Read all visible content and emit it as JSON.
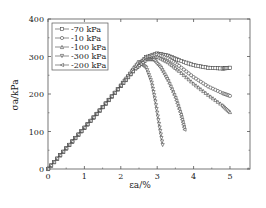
{
  "chart_data": {
    "type": "line",
    "title": "",
    "xlabel": "εa/%",
    "ylabel": "σa/kPa",
    "xlim": [
      0,
      5.55
    ],
    "ylim": [
      0,
      400
    ],
    "xticks": [
      0,
      1,
      2,
      3,
      4,
      5
    ],
    "yticks": [
      0,
      100,
      200,
      300,
      400
    ],
    "grid": false,
    "legend_position": "upper-left",
    "series": [
      {
        "name": "-70 kPa",
        "marker": "square",
        "x": [
          0,
          0.5,
          1.0,
          1.5,
          2.0,
          2.4,
          2.7,
          3.0,
          3.3,
          3.6,
          4.0,
          4.4,
          4.8,
          5.0
        ],
        "y": [
          0,
          55,
          110,
          165,
          222,
          270,
          298,
          308,
          302,
          290,
          277,
          270,
          268,
          270
        ]
      },
      {
        "name": "-10 kPa",
        "marker": "circle",
        "x": [
          0,
          0.5,
          1.0,
          1.5,
          2.0,
          2.4,
          2.7,
          3.0,
          3.3,
          3.6,
          4.0,
          4.4,
          4.8,
          5.0
        ],
        "y": [
          0,
          55,
          110,
          165,
          222,
          270,
          296,
          305,
          295,
          275,
          245,
          220,
          202,
          195
        ]
      },
      {
        "name": "-100 kPa",
        "marker": "triangle-up",
        "x": [
          0,
          0.5,
          1.0,
          1.5,
          2.0,
          2.4,
          2.7,
          3.0,
          3.3,
          3.6,
          4.0,
          4.4,
          4.8,
          5.0
        ],
        "y": [
          0,
          55,
          110,
          165,
          222,
          268,
          293,
          300,
          285,
          262,
          228,
          198,
          170,
          152
        ]
      },
      {
        "name": "-300 kPa",
        "marker": "triangle-down",
        "x": [
          0,
          0.5,
          1.0,
          1.5,
          2.0,
          2.3,
          2.5,
          2.7,
          2.85,
          2.95,
          3.05,
          3.15
        ],
        "y": [
          0,
          55,
          110,
          165,
          222,
          260,
          285,
          270,
          230,
          180,
          120,
          64
        ]
      },
      {
        "name": "-200 kPa",
        "marker": "triangle-left",
        "x": [
          0,
          0.5,
          1.0,
          1.5,
          2.0,
          2.4,
          2.7,
          2.9,
          3.1,
          3.3,
          3.5,
          3.65,
          3.75
        ],
        "y": [
          0,
          55,
          110,
          165,
          222,
          268,
          292,
          292,
          270,
          235,
          190,
          145,
          105
        ]
      }
    ]
  }
}
